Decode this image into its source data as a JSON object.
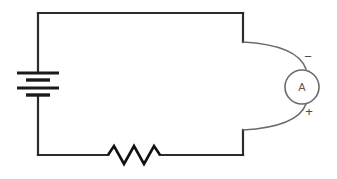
{
  "figure": {
    "kind": "circuit-schematic",
    "background_color": "#ffffff",
    "wire_color": "#2b2b2b",
    "lead_color": "#6b6b6b",
    "symbol_color": "#111111"
  },
  "components": {
    "battery": {
      "name": "battery",
      "symbol": "multi-cell-battery",
      "plates": [
        {
          "type": "long",
          "x1": 17,
          "x2": 59,
          "y": 73
        },
        {
          "type": "short",
          "x1": 26,
          "x2": 50,
          "y": 80
        },
        {
          "type": "long",
          "x1": 17,
          "x2": 59,
          "y": 88
        },
        {
          "type": "short",
          "x1": 26,
          "x2": 50,
          "y": 95
        }
      ]
    },
    "resistor": {
      "name": "resistor",
      "symbol": "zigzag-resistor",
      "peaks": 3,
      "path": "M 108 155 L 114 146 L 124 164 L 134 146 L 144 164 L 154 146 L 160 155"
    },
    "ammeter": {
      "name": "ammeter",
      "symbol": "circle-meter",
      "label": "A",
      "center_x": 302,
      "center_y": 87,
      "radius": 17,
      "terminals": [
        {
          "polarity_label": "−",
          "position": "top",
          "x": 308,
          "y": 58
        },
        {
          "polarity_label": "+",
          "position": "bottom",
          "x": 309,
          "y": 113
        }
      ]
    }
  },
  "wires": {
    "top_rail": "M 38 13 L 243 13",
    "left_rail_upper": "M 38 13 L 38 73",
    "left_rail_lower": "M 38 95 L 38 155",
    "bottom_rail_left": "M 38 155 L 108 155",
    "bottom_rail_right": "M 160 155 L 243 155",
    "right_stub_top": "M 243 13 L 243 42",
    "right_stub_bottom": "M 243 130 L 243 155",
    "lead_top_curve": "M 243 42 C 278 44 300 52 306 69",
    "lead_bottom_curve": "M 243 130 C 278 128 300 120 306 104"
  }
}
